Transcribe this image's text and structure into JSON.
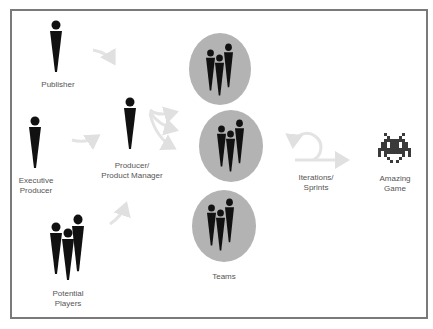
{
  "diagram": {
    "title": "",
    "colors": {
      "figure": "#111111",
      "team_circle": "#b3b3b3",
      "arrow": "#e3e3e3",
      "frame_border": "#7a7a7a",
      "label_text": "#555555",
      "invader": "#3a3a3a"
    },
    "nodes": {
      "publisher": {
        "label": "Publisher",
        "icon": "person-icon"
      },
      "executive_producer": {
        "label": "Executive\nProducer",
        "icon": "person-icon"
      },
      "potential_players": {
        "label": "Potential\nPlayers",
        "icon": "group-icon"
      },
      "producer": {
        "label": "Producer/\nProduct Manager",
        "icon": "person-icon"
      },
      "teams": {
        "label": "Teams",
        "icon": "group-icon",
        "count": 3
      },
      "iterations": {
        "label": "Iterations/\nSprints",
        "icon": "loop-arrow-icon"
      },
      "game": {
        "label": "Amazing\nGame",
        "icon": "space-invader-icon"
      }
    },
    "edges": [
      {
        "from": "publisher",
        "to": "producer"
      },
      {
        "from": "executive_producer",
        "to": "producer"
      },
      {
        "from": "potential_players",
        "to": "producer"
      },
      {
        "from": "producer",
        "to": "teams.0"
      },
      {
        "from": "producer",
        "to": "teams.1"
      },
      {
        "from": "producer",
        "to": "teams.2"
      },
      {
        "from": "teams",
        "to": "iterations"
      },
      {
        "from": "iterations",
        "to": "game"
      }
    ]
  }
}
